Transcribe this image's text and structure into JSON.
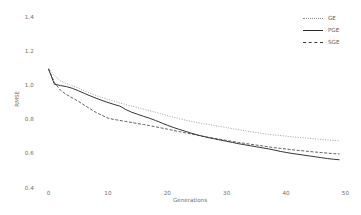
{
  "chart_data": {
    "type": "line",
    "title": "",
    "xlabel": "Generations",
    "ylabel": "RMSE",
    "xlim": [
      0,
      50
    ],
    "ylim": [
      0.4,
      1.4
    ],
    "xticks": [
      "0",
      "10",
      "20",
      "30",
      "40",
      "50"
    ],
    "yticks": [
      "0.4",
      "0.6",
      "0.8",
      "1.0",
      "1.2",
      "1.4"
    ],
    "grid": false,
    "legend_position": "top-right",
    "x": [
      0,
      1,
      2,
      3,
      4,
      5,
      6,
      7,
      8,
      9,
      10,
      11,
      12,
      13,
      14,
      15,
      16,
      17,
      18,
      19,
      20,
      21,
      22,
      23,
      24,
      25,
      26,
      27,
      28,
      29,
      30,
      31,
      32,
      33,
      34,
      35,
      36,
      37,
      38,
      39,
      40,
      41,
      42,
      43,
      44,
      45,
      46,
      47,
      48,
      49
    ],
    "series": [
      {
        "name": "GE",
        "style": "dotted",
        "color": "#8c8c8c",
        "values": [
          1.105,
          1.06,
          1.03,
          1.013,
          1.0,
          0.988,
          0.972,
          0.958,
          0.944,
          0.932,
          0.921,
          0.911,
          0.9,
          0.891,
          0.882,
          0.873,
          0.864,
          0.855,
          0.846,
          0.836,
          0.826,
          0.817,
          0.808,
          0.8,
          0.793,
          0.786,
          0.78,
          0.774,
          0.768,
          0.762,
          0.756,
          0.75,
          0.744,
          0.738,
          0.732,
          0.727,
          0.722,
          0.717,
          0.713,
          0.71,
          0.706,
          0.702,
          0.699,
          0.696,
          0.693,
          0.69,
          0.687,
          0.684,
          0.681,
          0.679
        ]
      },
      {
        "name": "PGE",
        "style": "solid",
        "color": "#2b2b2b",
        "values": [
          1.098,
          1.01,
          1.002,
          0.996,
          0.986,
          0.972,
          0.957,
          0.942,
          0.928,
          0.915,
          0.903,
          0.892,
          0.882,
          0.862,
          0.846,
          0.834,
          0.822,
          0.811,
          0.798,
          0.784,
          0.77,
          0.757,
          0.746,
          0.735,
          0.724,
          0.714,
          0.705,
          0.697,
          0.69,
          0.683,
          0.676,
          0.669,
          0.662,
          0.656,
          0.65,
          0.644,
          0.638,
          0.632,
          0.625,
          0.617,
          0.611,
          0.605,
          0.6,
          0.595,
          0.59,
          0.585,
          0.58,
          0.575,
          0.571,
          0.568
        ]
      },
      {
        "name": "SGE",
        "style": "dashed",
        "color": "#3a3a3a",
        "values": [
          1.1,
          1.02,
          0.975,
          0.95,
          0.93,
          0.91,
          0.888,
          0.866,
          0.845,
          0.828,
          0.812,
          0.804,
          0.798,
          0.792,
          0.786,
          0.78,
          0.774,
          0.768,
          0.761,
          0.754,
          0.747,
          0.74,
          0.733,
          0.726,
          0.719,
          0.712,
          0.705,
          0.699,
          0.693,
          0.687,
          0.681,
          0.675,
          0.669,
          0.664,
          0.659,
          0.654,
          0.649,
          0.644,
          0.639,
          0.635,
          0.631,
          0.627,
          0.623,
          0.62,
          0.616,
          0.613,
          0.61,
          0.607,
          0.604,
          0.602
        ]
      }
    ],
    "legend": [
      {
        "label": "GE",
        "style": "dotted"
      },
      {
        "label": "PGE",
        "style": "solid"
      },
      {
        "label": "SGE",
        "style": "dashed"
      }
    ]
  }
}
